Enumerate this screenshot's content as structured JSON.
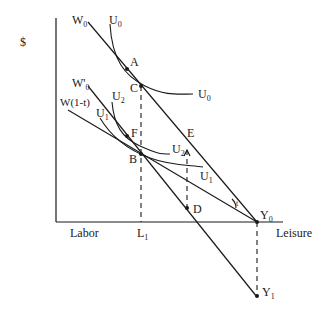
{
  "figure": {
    "y_axis_label": "$",
    "x_axis_left_label": "Labor",
    "x_axis_right_label": "Leisure",
    "lines": {
      "w0": {
        "label": "W",
        "sub": "0"
      },
      "w0_prime": {
        "label": "W'",
        "sub": "0"
      },
      "w_after_tax": {
        "label": "W",
        "sub": "(1-t)",
        "display": "W(1-t)"
      }
    },
    "curves": {
      "u0_top": {
        "label": "U",
        "sub": "0"
      },
      "u0_right": {
        "label": "U",
        "sub": "0"
      },
      "u2_top": {
        "label": "U",
        "sub": "2"
      },
      "u2_right": {
        "label": "U",
        "sub": "2"
      },
      "u1_top": {
        "label": "U",
        "sub": "1"
      },
      "u1_right": {
        "label": "U",
        "sub": "1"
      }
    },
    "points": {
      "A": "A",
      "C": "C",
      "F": "F",
      "B": "B",
      "E": "E",
      "D": "D",
      "Y0": {
        "label": "Y",
        "sub": "0"
      },
      "Y1": {
        "label": "Y",
        "sub": "1"
      }
    },
    "ticks": {
      "L1": {
        "label": "L",
        "sub": "1"
      }
    },
    "angle_mark": "t"
  }
}
